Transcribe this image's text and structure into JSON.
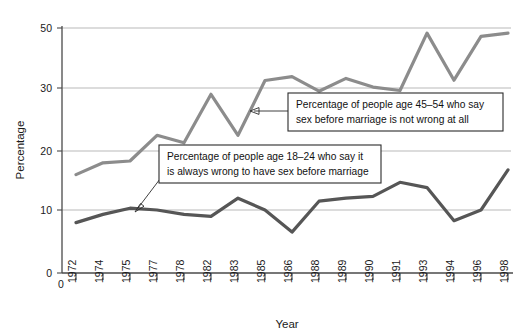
{
  "chart_data": {
    "type": "line",
    "title": "",
    "xlabel": "Year",
    "ylabel": "Percentage",
    "grid": true,
    "legend_position": "inline-annotations",
    "x": [
      1972,
      1974,
      1975,
      1977,
      1978,
      1982,
      1983,
      1985,
      1986,
      1988,
      1989,
      1990,
      1991,
      1993,
      1994,
      1996,
      1998
    ],
    "categories": [
      "1972",
      "1974",
      "1975",
      "1977",
      "1978",
      "1982",
      "1983",
      "1985",
      "1986",
      "1988",
      "1989",
      "1990",
      "1991",
      "1993",
      "1994",
      "1996",
      "1998"
    ],
    "ylim": [
      0,
      50
    ],
    "yticks": [
      0,
      10,
      20,
      30,
      50
    ],
    "ytick_labels": [
      "0",
      "10",
      "20",
      "30",
      "50"
    ],
    "y_axis_note": "Axis tick spacing is irregular: 0,10,20,30 evenly spaced, then 50",
    "series": [
      {
        "name": "Percentage of people age 45–54 who say sex before marriage is not wrong at all",
        "color": "#8c8c8c",
        "values": [
          16.0,
          18.0,
          18.3,
          22.5,
          21.3,
          29.0,
          22.5,
          32.5,
          33.8,
          29.5,
          33.2,
          30.3,
          29.6,
          48.3,
          32.6,
          47.2,
          48.3
        ]
      },
      {
        "name": "Percentage of people age 18–24 who say it is always wrong to have sex before marriage",
        "color": "#565656",
        "values": [
          8.0,
          9.3,
          10.3,
          10.0,
          9.3,
          9.0,
          12.0,
          10.0,
          6.5,
          11.5,
          12.0,
          12.3,
          14.7,
          13.8,
          8.3,
          10.0,
          16.8
        ]
      }
    ],
    "annotations": [
      {
        "id": "anno-45-54",
        "lines": [
          "Percentage of people age 45–54 who say",
          "sex before marriage is not wrong at all"
        ]
      },
      {
        "id": "anno-18-24",
        "lines": [
          "Percentage of people age 18–24 who say it",
          "is always wrong to have sex before marriage"
        ]
      }
    ],
    "colors": {
      "series_upper": "#8c8c8c",
      "series_lower": "#565656",
      "gridline": "#b9b9b9",
      "axis": "#4a4a4a",
      "text": "#1a1a1a",
      "background": "#ffffff"
    }
  },
  "axes": {
    "y_title": "Percentage",
    "x_title": "Year",
    "y_labels": [
      "50",
      "30",
      "20",
      "10",
      "0"
    ],
    "x_origin_label": "0",
    "x_labels": [
      "1972",
      "1974",
      "1975",
      "1977",
      "1978",
      "1982",
      "1983",
      "1985",
      "1986",
      "1988",
      "1989",
      "1990",
      "1991",
      "1993",
      "1994",
      "1996",
      "1998"
    ]
  },
  "annotation_upper": {
    "line1": "Percentage of people age 45–54 who say",
    "line2": "sex before marriage is not wrong at all"
  },
  "annotation_lower": {
    "line1": "Percentage of people age 18–24 who say it",
    "line2": "is always wrong to have sex before marriage"
  }
}
